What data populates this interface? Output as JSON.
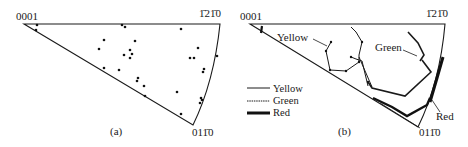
{
  "figure": {
    "panels": [
      {
        "id": "a",
        "caption": "(a)",
        "corners": {
          "top_left": "0001",
          "top_right": "1̄21̄0",
          "bottom": "011̄0"
        },
        "points": [
          [
            37,
            25
          ],
          [
            36,
            30
          ],
          [
            122,
            25
          ],
          [
            125,
            27
          ],
          [
            181,
            29
          ],
          [
            104,
            40
          ],
          [
            99,
            49
          ],
          [
            135,
            41
          ],
          [
            130,
            50
          ],
          [
            132,
            54
          ],
          [
            124,
            55
          ],
          [
            130,
            58
          ],
          [
            198,
            48
          ],
          [
            190,
            58
          ],
          [
            194,
            58
          ],
          [
            217,
            56
          ],
          [
            104,
            68
          ],
          [
            119,
            70
          ],
          [
            204,
            69
          ],
          [
            203,
            72
          ],
          [
            138,
            78
          ],
          [
            137,
            81
          ],
          [
            144,
            86
          ],
          [
            177,
            92
          ],
          [
            145,
            96
          ],
          [
            201,
            98
          ],
          [
            202,
            100
          ],
          [
            200,
            103
          ],
          [
            181,
            114
          ]
        ]
      },
      {
        "id": "b",
        "caption": "(b)",
        "corners": {
          "top_left": "0001",
          "top_right": "1̄21̄0",
          "bottom": "011̄0"
        },
        "annotations": [
          {
            "text": "Yellow",
            "x": 264,
            "y": 41
          },
          {
            "text": "Green",
            "x": 375,
            "y": 50
          },
          {
            "text": "Red",
            "x": 436,
            "y": 120
          }
        ],
        "legend": [
          {
            "label": "Yellow",
            "style": "thin"
          },
          {
            "label": "Green",
            "style": "dotted"
          },
          {
            "label": "Red",
            "style": "thick"
          }
        ]
      }
    ]
  }
}
